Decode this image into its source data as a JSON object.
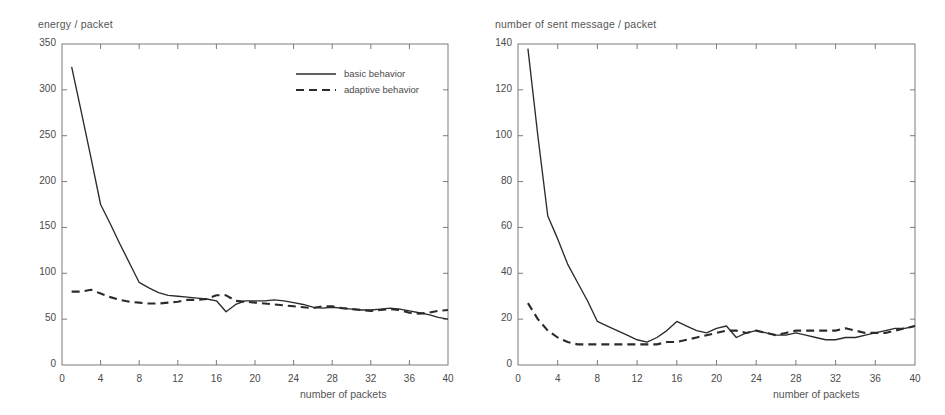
{
  "figure": {
    "kind": "two-panel-line-chart-figure",
    "background": "#ffffff",
    "line_color": "#2b2b2b",
    "axis_color": "#6d6d6d"
  },
  "chart_data": [
    {
      "type": "line",
      "panel": "left",
      "title": "",
      "ylabel": "energy / packet",
      "xlabel": "number of packets",
      "xlim": [
        0,
        40
      ],
      "ylim": [
        0,
        350
      ],
      "xticks": [
        0,
        4,
        8,
        12,
        16,
        20,
        24,
        28,
        32,
        36,
        40
      ],
      "yticks": [
        0,
        50,
        100,
        150,
        200,
        250,
        300,
        350
      ],
      "xtick_labels": [
        "0",
        "4",
        "8",
        "12",
        "16",
        "20",
        "24",
        "28",
        "32",
        "36",
        "40"
      ],
      "ytick_labels": [
        "0",
        "50",
        "100",
        "150",
        "200",
        "250",
        "300",
        "350"
      ],
      "grid": false,
      "legend_position": "upper-right-inside",
      "series": [
        {
          "name": "basic behavior",
          "style": "solid",
          "color": "#2b2b2b",
          "x": [
            1,
            2,
            3,
            4,
            5,
            6,
            7,
            8,
            9,
            10,
            11,
            12,
            13,
            14,
            15,
            16,
            17,
            18,
            19,
            20,
            21,
            22,
            23,
            24,
            25,
            26,
            27,
            28,
            29,
            30,
            31,
            32,
            33,
            34,
            35,
            36,
            37,
            38,
            39,
            40
          ],
          "values": [
            325,
            276,
            226,
            175,
            154,
            132,
            111,
            90,
            84,
            79,
            76,
            75,
            74,
            73,
            72,
            70,
            58,
            66,
            70,
            70,
            70,
            71,
            70,
            68,
            66,
            63,
            62,
            63,
            62,
            61,
            60,
            60,
            61,
            62,
            61,
            59,
            57,
            55,
            52,
            50
          ]
        },
        {
          "name": "adaptive behavior",
          "style": "dashed",
          "color": "#2b2b2b",
          "x": [
            1,
            2,
            3,
            4,
            5,
            6,
            7,
            8,
            9,
            10,
            11,
            12,
            13,
            14,
            15,
            16,
            17,
            18,
            19,
            20,
            21,
            22,
            23,
            24,
            25,
            26,
            27,
            28,
            29,
            30,
            31,
            32,
            33,
            34,
            35,
            36,
            37,
            38,
            39,
            40
          ],
          "values": [
            80,
            80,
            82,
            78,
            74,
            71,
            69,
            68,
            67,
            67,
            68,
            69,
            71,
            71,
            72,
            76,
            76,
            70,
            69,
            68,
            67,
            66,
            65,
            64,
            63,
            62,
            64,
            64,
            62,
            61,
            60,
            59,
            60,
            61,
            60,
            57,
            56,
            57,
            59,
            60
          ]
        }
      ]
    },
    {
      "type": "line",
      "panel": "right",
      "title": "",
      "ylabel": "number of sent message / packet",
      "xlabel": "number of packets",
      "xlim": [
        0,
        40
      ],
      "ylim": [
        0,
        140
      ],
      "xticks": [
        0,
        4,
        8,
        12,
        16,
        20,
        24,
        28,
        32,
        36,
        40
      ],
      "yticks": [
        0,
        20,
        40,
        60,
        80,
        100,
        120,
        140
      ],
      "xtick_labels": [
        "0",
        "4",
        "8",
        "12",
        "16",
        "20",
        "24",
        "28",
        "32",
        "36",
        "40"
      ],
      "ytick_labels": [
        "0",
        "20",
        "40",
        "60",
        "80",
        "100",
        "120",
        "140"
      ],
      "grid": false,
      "legend_position": "none",
      "series": [
        {
          "name": "basic behavior",
          "style": "solid",
          "color": "#2b2b2b",
          "x": [
            1,
            2,
            3,
            4,
            5,
            6,
            7,
            8,
            9,
            10,
            11,
            12,
            13,
            14,
            15,
            16,
            17,
            18,
            19,
            20,
            21,
            22,
            23,
            24,
            25,
            26,
            27,
            28,
            29,
            30,
            31,
            32,
            33,
            34,
            35,
            36,
            37,
            38,
            39,
            40
          ],
          "values": [
            138,
            100,
            65,
            55,
            44,
            36,
            28,
            19,
            17,
            15,
            13,
            11,
            10,
            12,
            15,
            19,
            17,
            15,
            14,
            16,
            17,
            12,
            14,
            15,
            14,
            13,
            13,
            14,
            13,
            12,
            11,
            11,
            12,
            12,
            13,
            14,
            15,
            16,
            16,
            17
          ]
        },
        {
          "name": "adaptive behavior",
          "style": "dashed",
          "color": "#2b2b2b",
          "x": [
            1,
            2,
            3,
            4,
            5,
            6,
            7,
            8,
            9,
            10,
            11,
            12,
            13,
            14,
            15,
            16,
            17,
            18,
            19,
            20,
            21,
            22,
            23,
            24,
            25,
            26,
            27,
            28,
            29,
            30,
            31,
            32,
            33,
            34,
            35,
            36,
            37,
            38,
            39,
            40
          ],
          "values": [
            27,
            20,
            15,
            12,
            10,
            9,
            9,
            9,
            9,
            9,
            9,
            9,
            9,
            9,
            10,
            10,
            11,
            12,
            13,
            14,
            15,
            15,
            14,
            15,
            14,
            13,
            14,
            15,
            15,
            15,
            15,
            15,
            16,
            15,
            14,
            14,
            14,
            15,
            16,
            17
          ]
        }
      ]
    }
  ],
  "left_panel": {
    "axis_title": "energy / packet",
    "x_axis_title": "number of packets",
    "legend": [
      {
        "label": "basic behavior",
        "style": "solid"
      },
      {
        "label": "adaptive behavior",
        "style": "dashed"
      }
    ]
  },
  "right_panel": {
    "axis_title": "number of sent message / packet",
    "x_axis_title": "number of packets"
  }
}
